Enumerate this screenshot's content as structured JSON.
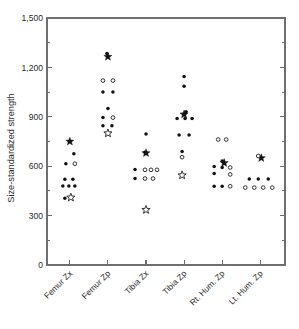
{
  "chart_data": {
    "type": "scatter",
    "title": "",
    "xlabel": "",
    "ylabel": "Size-standardized strength",
    "ylim": [
      0,
      1500
    ],
    "yticks": [
      0,
      300,
      600,
      900,
      1200,
      1500
    ],
    "ytick_labels": [
      "0",
      "300",
      "600",
      "900",
      "1,200",
      "1,500"
    ],
    "yminor_ticks": [
      150,
      450,
      750,
      1050,
      1350
    ],
    "grid": false,
    "legend": "none",
    "categories": [
      "Femur Zx",
      "Femur Zp",
      "Tibia Zx",
      "Tibia Zp",
      "Rt. Hum. Zp",
      "Lt. Hum. Zp"
    ],
    "marker_types": [
      "filled-circle",
      "open-circle",
      "filled-star",
      "open-star"
    ],
    "groups": [
      {
        "category": "Femur Zx",
        "points": [
          {
            "value": 750,
            "marker": "filled-star",
            "offset": 0
          },
          {
            "value": 675,
            "marker": "filled-circle",
            "offset": 4
          },
          {
            "value": 615,
            "marker": "filled-circle",
            "offset": -4
          },
          {
            "value": 615,
            "marker": "open-circle",
            "offset": 5
          },
          {
            "value": 520,
            "marker": "filled-circle",
            "offset": -5
          },
          {
            "value": 520,
            "marker": "filled-circle",
            "offset": 3
          },
          {
            "value": 480,
            "marker": "filled-circle",
            "offset": -7
          },
          {
            "value": 480,
            "marker": "filled-circle",
            "offset": -1
          },
          {
            "value": 480,
            "marker": "filled-circle",
            "offset": 5
          },
          {
            "value": 410,
            "marker": "open-star",
            "offset": 1
          },
          {
            "value": 405,
            "marker": "filled-circle",
            "offset": -5
          }
        ]
      },
      {
        "category": "Femur Zp",
        "points": [
          {
            "value": 1265,
            "marker": "filled-star",
            "offset": 0
          },
          {
            "value": 1285,
            "marker": "filled-circle",
            "offset": -1
          },
          {
            "value": 1120,
            "marker": "open-circle",
            "offset": -5
          },
          {
            "value": 1120,
            "marker": "open-circle",
            "offset": 5
          },
          {
            "value": 1050,
            "marker": "filled-circle",
            "offset": -5
          },
          {
            "value": 1050,
            "marker": "filled-circle",
            "offset": 5
          },
          {
            "value": 950,
            "marker": "filled-circle",
            "offset": 0
          },
          {
            "value": 895,
            "marker": "filled-circle",
            "offset": -5
          },
          {
            "value": 895,
            "marker": "open-circle",
            "offset": 5
          },
          {
            "value": 845,
            "marker": "filled-circle",
            "offset": -5
          },
          {
            "value": 845,
            "marker": "filled-circle",
            "offset": 4
          },
          {
            "value": 800,
            "marker": "open-star",
            "offset": 0
          }
        ]
      },
      {
        "category": "Tibia Zx",
        "points": [
          {
            "value": 795,
            "marker": "filled-circle",
            "offset": 0
          },
          {
            "value": 680,
            "marker": "filled-star",
            "offset": 0
          },
          {
            "value": 685,
            "marker": "filled-circle",
            "offset": -1
          },
          {
            "value": 580,
            "marker": "filled-circle",
            "offset": -11
          },
          {
            "value": 578,
            "marker": "open-circle",
            "offset": -1
          },
          {
            "value": 578,
            "marker": "open-circle",
            "offset": 5
          },
          {
            "value": 578,
            "marker": "open-circle",
            "offset": 11
          },
          {
            "value": 525,
            "marker": "filled-circle",
            "offset": -11
          },
          {
            "value": 525,
            "marker": "open-circle",
            "offset": -1
          },
          {
            "value": 525,
            "marker": "open-circle",
            "offset": 7
          },
          {
            "value": 335,
            "marker": "open-star",
            "offset": 0
          }
        ]
      },
      {
        "category": "Tibia Zp",
        "points": [
          {
            "value": 1145,
            "marker": "filled-circle",
            "offset": 0
          },
          {
            "value": 1085,
            "marker": "filled-circle",
            "offset": 0
          },
          {
            "value": 915,
            "marker": "filled-star",
            "offset": 0
          },
          {
            "value": 930,
            "marker": "filled-circle",
            "offset": 2
          },
          {
            "value": 890,
            "marker": "filled-circle",
            "offset": -7
          },
          {
            "value": 890,
            "marker": "filled-circle",
            "offset": 1
          },
          {
            "value": 890,
            "marker": "filled-circle",
            "offset": 8
          },
          {
            "value": 790,
            "marker": "filled-circle",
            "offset": -5
          },
          {
            "value": 790,
            "marker": "filled-circle",
            "offset": 5
          },
          {
            "value": 690,
            "marker": "filled-circle",
            "offset": -2
          },
          {
            "value": 655,
            "marker": "open-circle",
            "offset": -2
          },
          {
            "value": 545,
            "marker": "open-star",
            "offset": -2
          }
        ]
      },
      {
        "category": "Rt. Hum. Zp",
        "points": [
          {
            "value": 762,
            "marker": "open-circle",
            "offset": -4
          },
          {
            "value": 762,
            "marker": "open-circle",
            "offset": 4
          },
          {
            "value": 620,
            "marker": "filled-star",
            "offset": 2
          },
          {
            "value": 632,
            "marker": "filled-circle",
            "offset": 0
          },
          {
            "value": 598,
            "marker": "filled-circle",
            "offset": -8
          },
          {
            "value": 592,
            "marker": "filled-circle",
            "offset": 0
          },
          {
            "value": 592,
            "marker": "open-circle",
            "offset": 8
          },
          {
            "value": 555,
            "marker": "filled-circle",
            "offset": -8
          },
          {
            "value": 550,
            "marker": "open-circle",
            "offset": 8
          },
          {
            "value": 478,
            "marker": "filled-circle",
            "offset": -8
          },
          {
            "value": 478,
            "marker": "filled-circle",
            "offset": 0
          },
          {
            "value": 478,
            "marker": "open-circle",
            "offset": 8
          }
        ]
      },
      {
        "category": "Lt. Hum. Zp",
        "points": [
          {
            "value": 650,
            "marker": "filled-star",
            "offset": 1
          },
          {
            "value": 662,
            "marker": "open-circle",
            "offset": -2
          },
          {
            "value": 522,
            "marker": "filled-circle",
            "offset": -11
          },
          {
            "value": 522,
            "marker": "filled-circle",
            "offset": -2
          },
          {
            "value": 522,
            "marker": "filled-circle",
            "offset": 8
          },
          {
            "value": 470,
            "marker": "open-circle",
            "offset": -15
          },
          {
            "value": 470,
            "marker": "open-circle",
            "offset": -6
          },
          {
            "value": 470,
            "marker": "open-circle",
            "offset": 3
          },
          {
            "value": 470,
            "marker": "open-circle",
            "offset": 12
          }
        ]
      }
    ]
  },
  "axis": {
    "frame_color": "#6f6f6f",
    "marker_color": "#111111"
  }
}
